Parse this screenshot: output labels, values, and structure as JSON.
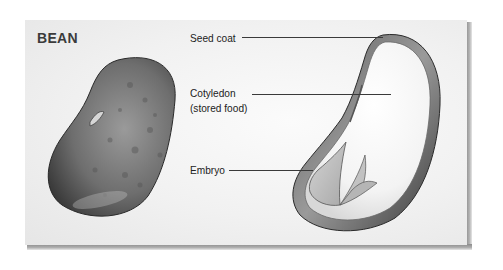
{
  "diagram": {
    "title": "BEAN",
    "labels": [
      {
        "id": "seed-coat",
        "text": "Seed coat"
      },
      {
        "id": "cotyledon",
        "text": "Cotyledon",
        "subtext": "(stored food)"
      },
      {
        "id": "embryo",
        "text": "Embryo"
      }
    ],
    "figures": [
      {
        "id": "whole-bean",
        "description": "Exterior view of a whole bean seed"
      },
      {
        "id": "bean-cross-section",
        "description": "Cut-away view of bean showing seed coat, cotyledon and embryo"
      }
    ],
    "colors": {
      "panel_background": "#f1f1f1",
      "panel_shadow": "#8d8d8d",
      "text": "#222222",
      "title": "#3b3b3b",
      "leader_line": "#3a3a3a"
    }
  }
}
